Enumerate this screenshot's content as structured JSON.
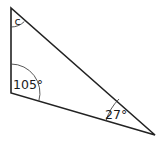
{
  "diagram": {
    "type": "triangle",
    "colors": {
      "stroke": "#222222",
      "background": "#ffffff"
    },
    "vertices": {
      "top": [
        11,
        8
      ],
      "bottom_left": [
        11,
        93
      ],
      "right": [
        155,
        135
      ]
    },
    "angles": {
      "top": {
        "label": "c"
      },
      "bottom_left": {
        "label": "105°"
      },
      "right": {
        "label": "27°"
      }
    }
  }
}
